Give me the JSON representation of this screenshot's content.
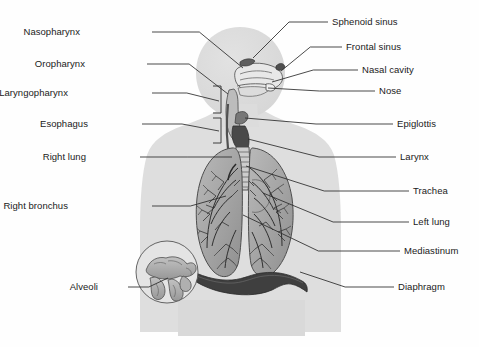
{
  "diagram": {
    "type": "labeled-anatomical-illustration",
    "background_color": "#ffffff",
    "line_color": "#2b2b2b",
    "body_silhouette_color": "#dcdcdc",
    "organ_fill_color": "#a8a8a8",
    "diaphragm_color": "#3d3d3d",
    "text_color": "#1a1a1a"
  },
  "labels_left": [
    {
      "id": "nasopharynx",
      "text": "Nasopharynx",
      "text_x": 80,
      "text_y": 32,
      "line_x1": 152,
      "line_y1": 32,
      "line_x2": 243,
      "line_y2": 68
    },
    {
      "id": "oropharynx",
      "text": "Oropharynx",
      "text_x": 85,
      "text_y": 64,
      "line_x1": 147,
      "line_y1": 64,
      "line_x2": 228,
      "line_y2": 94
    },
    {
      "id": "laryngopharynx",
      "text": "Laryngopharynx",
      "text_x": 68,
      "text_y": 93,
      "line_x1": 152,
      "line_y1": 93,
      "line_x2": 219,
      "line_y2": 101
    },
    {
      "id": "esophagus",
      "text": "Esophagus",
      "text_x": 88,
      "text_y": 124,
      "line_x1": 142,
      "line_y1": 124,
      "line_x2": 219,
      "line_y2": 131
    },
    {
      "id": "right-lung",
      "text": "Right lung",
      "text_x": 86,
      "text_y": 157,
      "line_x1": 140,
      "line_y1": 157,
      "line_x2": 232,
      "line_y2": 157
    },
    {
      "id": "right-bronchus",
      "text": "Right bronchus",
      "text_x": 68,
      "text_y": 206,
      "line_x1": 152,
      "line_y1": 206,
      "line_x2": 226,
      "line_y2": 196
    },
    {
      "id": "alveoli",
      "text": "Alveoli",
      "text_x": 98,
      "text_y": 287,
      "line_x1": 128,
      "line_y1": 287,
      "line_x2": 168,
      "line_y2": 278
    }
  ],
  "labels_right": [
    {
      "id": "sphenoid-sinus",
      "text": "Sphenoid sinus",
      "text_x": 332,
      "text_y": 22,
      "line_x1": 328,
      "line_y1": 22,
      "line_x2": 253,
      "line_y2": 58
    },
    {
      "id": "frontal-sinus",
      "text": "Frontal sinus",
      "text_x": 346,
      "text_y": 47,
      "line_x1": 342,
      "line_y1": 47,
      "line_x2": 281,
      "line_y2": 71
    },
    {
      "id": "nasal-cavity",
      "text": "Nasal cavity",
      "text_x": 362,
      "text_y": 70,
      "line_x1": 358,
      "line_y1": 70,
      "line_x2": 272,
      "line_y2": 82
    },
    {
      "id": "nose",
      "text": "Nose",
      "text_x": 379,
      "text_y": 91,
      "line_x1": 375,
      "line_y1": 91,
      "line_x2": 268,
      "line_y2": 88
    },
    {
      "id": "epiglottis",
      "text": "Epiglottis",
      "text_x": 397,
      "text_y": 124,
      "line_x1": 393,
      "line_y1": 124,
      "line_x2": 245,
      "line_y2": 118
    },
    {
      "id": "larynx",
      "text": "Larynx",
      "text_x": 400,
      "text_y": 157,
      "line_x1": 396,
      "line_y1": 157,
      "line_x2": 248,
      "line_y2": 139
    },
    {
      "id": "trachea",
      "text": "Trachea",
      "text_x": 413,
      "text_y": 191,
      "line_x1": 409,
      "line_y1": 191,
      "line_x2": 246,
      "line_y2": 166
    },
    {
      "id": "left-lung",
      "text": "Left lung",
      "text_x": 413,
      "text_y": 222,
      "line_x1": 409,
      "line_y1": 222,
      "line_x2": 263,
      "line_y2": 193
    },
    {
      "id": "mediastinum",
      "text": "Mediastinum",
      "text_x": 404,
      "text_y": 251,
      "line_x1": 400,
      "line_y1": 251,
      "line_x2": 243,
      "line_y2": 215
    },
    {
      "id": "diaphragm",
      "text": "Diaphragm",
      "text_x": 398,
      "text_y": 287,
      "line_x1": 394,
      "line_y1": 287,
      "line_x2": 300,
      "line_y2": 272
    }
  ],
  "structures": {
    "head": "head-silhouette",
    "torso": "torso-silhouette",
    "right_lung": "right-lung-shape",
    "left_lung": "left-lung-shape",
    "trachea": "trachea-shape",
    "diaphragm": "diaphragm-shape",
    "alveoli_inset": "alveoli-inset-circle",
    "bracket_upper": "pharynx-bracket-upper",
    "bracket_lower": "pharynx-bracket-lower"
  }
}
